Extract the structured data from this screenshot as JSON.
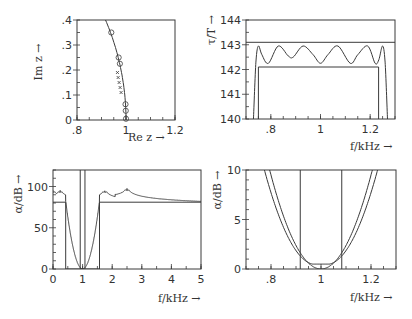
{
  "chart_data": [
    {
      "id": "pole-zero",
      "type": "scatter",
      "title": "",
      "xlabel": "Re z →",
      "ylabel": "Im z →",
      "xlim": [
        0.8,
        1.2
      ],
      "ylim": [
        0,
        0.4
      ],
      "xticks": [
        ".8",
        "1",
        "1.2"
      ],
      "xtick_values": [
        0.8,
        1.0,
        1.2
      ],
      "yticks": [
        "0",
        ".1",
        ".2",
        ".3",
        ".4"
      ],
      "ytick_values": [
        0,
        0.1,
        0.2,
        0.3,
        0.4
      ],
      "grid": false,
      "series": [
        {
          "name": "unit circle",
          "style": "line"
        },
        {
          "name": "zeros (circles)",
          "style": "o",
          "points": [
            [
              0.94,
              0.35
            ],
            [
              0.97,
              0.25
            ],
            [
              0.975,
              0.225
            ],
            [
              0.998,
              0.063
            ],
            [
              0.999,
              0.037
            ],
            [
              1.0,
              0.005
            ]
          ]
        },
        {
          "name": "poles (crosses)",
          "style": "x",
          "points": [
            [
              0.965,
              0.19
            ],
            [
              0.968,
              0.17
            ],
            [
              0.972,
              0.15
            ],
            [
              0.976,
              0.13
            ],
            [
              0.98,
              0.11
            ]
          ]
        }
      ]
    },
    {
      "id": "group-delay",
      "type": "line",
      "title": "",
      "xlabel": "f/kHz →",
      "ylabel": "τ/T →",
      "xlim": [
        0.7,
        1.3
      ],
      "ylim": [
        140,
        144
      ],
      "xticks": [
        ".8",
        "1",
        "1.2"
      ],
      "xtick_values": [
        0.8,
        1.0,
        1.2
      ],
      "yticks": [
        "140",
        "141",
        "142",
        "143",
        "144"
      ],
      "ytick_values": [
        140,
        141,
        142,
        143,
        144
      ],
      "grid": false,
      "series": [
        {
          "name": "upper bound",
          "x": [
            0.7,
            1.3
          ],
          "values": [
            143.1,
            143.1
          ]
        },
        {
          "name": "lower tolerance",
          "x": [
            0.75,
            0.75,
            1.234,
            1.234
          ],
          "values": [
            140,
            142.1,
            142.1,
            140
          ]
        },
        {
          "name": "group delay",
          "x": [
            0.73,
            0.74,
            0.75,
            0.764,
            0.79,
            0.83,
            0.87,
            0.89,
            0.93,
            0.97,
            1.0,
            1.03,
            1.07,
            1.12,
            1.15,
            1.19,
            1.22,
            1.235,
            1.25,
            1.26,
            1.27
          ],
          "values": [
            140,
            142.3,
            142.95,
            142.6,
            142.25,
            142.95,
            142.55,
            142.5,
            142.95,
            142.6,
            142.25,
            142.6,
            142.95,
            142.25,
            142.6,
            142.95,
            142.25,
            142.4,
            142.95,
            142.3,
            140
          ]
        }
      ]
    },
    {
      "id": "attenuation-wide",
      "type": "line",
      "title": "",
      "xlabel": "f/kHz →",
      "ylabel": "α/dB →",
      "xlim": [
        0,
        5
      ],
      "ylim": [
        0,
        120
      ],
      "xticks": [
        "0",
        "1",
        "2",
        "3",
        "4",
        "5"
      ],
      "xtick_values": [
        0,
        1,
        2,
        3,
        4,
        5
      ],
      "yticks": [
        "0",
        "50",
        "100"
      ],
      "ytick_values": [
        0,
        50,
        100
      ],
      "grid": false,
      "series": [
        {
          "name": "tolerance scheme",
          "x": [
            0,
            0.43,
            0.43,
            1.57,
            1.57,
            5
          ],
          "values": [
            81,
            81,
            0,
            0,
            81,
            81
          ]
        },
        {
          "name": "passband edges",
          "x": [
            0.92,
            1.08
          ],
          "values": [
            120,
            120
          ]
        },
        {
          "name": "attenuation",
          "poles_kHz": [
            0.0,
            0.24,
            1.75,
            2.5
          ],
          "x": [
            0.05,
            0.15,
            0.24,
            0.32,
            0.45,
            0.6,
            0.8,
            1.0,
            1.2,
            1.4,
            1.55,
            1.65,
            1.75,
            1.85,
            2.0,
            2.3,
            2.5,
            2.7,
            3.0,
            3.5,
            4.0,
            5.0
          ],
          "values": [
            105,
            95,
            120,
            96,
            82,
            40,
            8,
            0,
            8,
            40,
            82,
            95,
            120,
            90,
            84,
            95,
            120,
            93,
            88,
            86,
            85,
            85
          ]
        }
      ]
    },
    {
      "id": "attenuation-passband",
      "type": "line",
      "title": "",
      "xlabel": "f/kHz →",
      "ylabel": "α/dB →",
      "xlim": [
        0.7,
        1.3
      ],
      "ylim": [
        0,
        10
      ],
      "xticks": [
        ".8",
        "1",
        "1.2"
      ],
      "xtick_values": [
        0.8,
        1.0,
        1.2
      ],
      "yticks": [
        "0",
        "5",
        "10"
      ],
      "ytick_values": [
        0,
        5,
        10
      ],
      "grid": false,
      "series": [
        {
          "name": "passband edges",
          "x": [
            0.917,
            1.083
          ],
          "values": [
            10,
            10
          ]
        },
        {
          "name": "tolerance bound",
          "x": [
            0.7,
            0.78,
            0.85,
            0.917,
            0.96,
            1.04,
            1.083,
            1.15,
            1.22,
            1.3
          ],
          "values": [
            14,
            10,
            5.4,
            1.5,
            0.5,
            0.5,
            1.5,
            5.4,
            10,
            14
          ]
        },
        {
          "name": "attenuation",
          "x": [
            0.7,
            0.78,
            0.85,
            0.917,
            0.96,
            1.0,
            1.04,
            1.083,
            1.15,
            1.22,
            1.3
          ],
          "values": [
            14,
            10.2,
            5.6,
            1.6,
            0.4,
            0,
            0.4,
            1.6,
            5.6,
            10.2,
            14
          ]
        }
      ]
    }
  ],
  "labels": {
    "p1_x": "Re z →",
    "p1_y": "Im z →",
    "p2_x": "f/kHz →",
    "p2_y": "τ/T →",
    "p3_x": "f/kHz →",
    "p3_y": "α/dB →",
    "p4_x": "f/kHz →",
    "p4_y": "α/dB →"
  },
  "colors": {
    "ink": "#3a3a3a",
    "background": "#ffffff"
  }
}
